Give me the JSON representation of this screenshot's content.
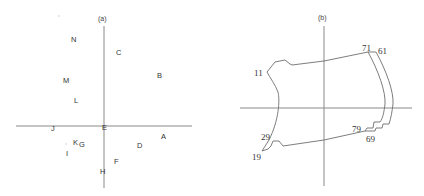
{
  "figure": {
    "panel_a": {
      "title": "(a)",
      "labels": [
        {
          "text": "N",
          "x": 74,
          "y": 42
        },
        {
          "text": "C",
          "x": 118,
          "y": 55
        },
        {
          "text": "B",
          "x": 160,
          "y": 78
        },
        {
          "text": "M",
          "x": 66,
          "y": 83
        },
        {
          "text": "L",
          "x": 76,
          "y": 103
        },
        {
          "text": "J",
          "x": 52,
          "y": 131
        },
        {
          "text": "E",
          "x": 104,
          "y": 130
        },
        {
          "text": "A",
          "x": 163,
          "y": 139
        },
        {
          "text": "K",
          "x": 76,
          "y": 145
        },
        {
          "text": "G",
          "x": 82,
          "y": 147
        },
        {
          "text": "D",
          "x": 139,
          "y": 148
        },
        {
          "text": "I",
          "x": 66,
          "y": 156
        },
        {
          "text": "F",
          "x": 116,
          "y": 164
        },
        {
          "text": "H",
          "x": 102,
          "y": 174
        }
      ]
    },
    "panel_b": {
      "title": "(b)",
      "labels": [
        {
          "text": "71",
          "x": 366,
          "y": 52
        },
        {
          "text": "61",
          "x": 383,
          "y": 54
        },
        {
          "text": "11",
          "x": 255,
          "y": 74
        },
        {
          "text": "79",
          "x": 355,
          "y": 131
        },
        {
          "text": "69",
          "x": 368,
          "y": 141
        },
        {
          "text": "29",
          "x": 261,
          "y": 140
        },
        {
          "text": "19",
          "x": 252,
          "y": 160
        }
      ]
    }
  }
}
